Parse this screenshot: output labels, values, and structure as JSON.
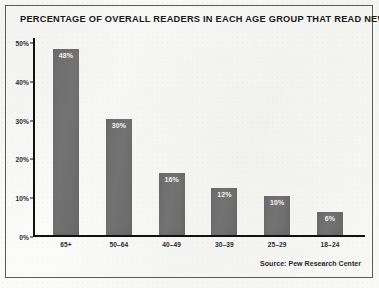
{
  "title": "PERCENTAGE OF OVERALL READERS IN EACH AGE GROUP THAT READ NEWSPAPERS",
  "source": "Source: Pew Research Center",
  "colors": {
    "bar_fill": "#706f70",
    "axis": "#111111",
    "frame": "#5b5b5b",
    "page_background": "#f8f8f7",
    "title_text": "#1a1a1a",
    "value_label_text": "#f2f2f2"
  },
  "chart_data": {
    "type": "bar",
    "title": "PERCENTAGE OF OVERALL READERS IN EACH AGE GROUP THAT READ NEWSPAPERS",
    "xlabel": "",
    "ylabel": "",
    "categories": [
      "65+",
      "50–64",
      "40–49",
      "30–39",
      "25–29",
      "18–24"
    ],
    "values": [
      48,
      30,
      16,
      12,
      10,
      6
    ],
    "value_labels": [
      "48%",
      "30%",
      "16%",
      "12%",
      "10%",
      "6%"
    ],
    "ylim": [
      0,
      50
    ],
    "yticks": [
      0,
      10,
      20,
      30,
      40,
      50
    ],
    "ytick_labels": [
      "0%",
      "10%",
      "20%",
      "30%",
      "40%",
      "50%"
    ],
    "grid": false,
    "legend": false,
    "source": "Source: Pew Research Center"
  }
}
